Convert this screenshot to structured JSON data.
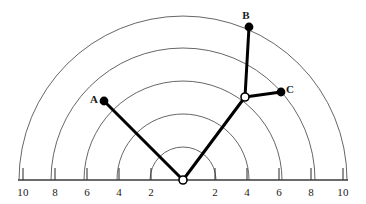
{
  "figure": {
    "background_color": "#ffffff",
    "line_color": "#000000",
    "arc_color": "#555555",
    "axis_color": "#3a3a3a"
  },
  "axis": {
    "name": "horizontal-baseline",
    "y_px": 180,
    "x_start_px": 18,
    "x_end_px": 348,
    "origin_x_px": 183,
    "tick_length_px": 12,
    "labels": [
      {
        "text": "10",
        "value": -10,
        "x_px": 23
      },
      {
        "text": "8",
        "value": -8,
        "x_px": 55
      },
      {
        "text": "6",
        "value": -6,
        "x_px": 87
      },
      {
        "text": "4",
        "value": -4,
        "x_px": 119
      },
      {
        "text": "2",
        "value": -2,
        "x_px": 151
      },
      {
        "text": "2",
        "value": 2,
        "x_px": 215
      },
      {
        "text": "4",
        "value": 4,
        "x_px": 247
      },
      {
        "text": "6",
        "value": 6,
        "x_px": 279
      },
      {
        "text": "8",
        "value": 8,
        "x_px": 311
      },
      {
        "text": "10",
        "value": 10,
        "x_px": 343
      }
    ],
    "label_y_px": 186
  },
  "chart_data": {
    "type": "scatter",
    "xlabel": "",
    "ylabel": "",
    "xlim": [
      -10,
      10
    ],
    "ylim": [
      0,
      10
    ],
    "grid": "polar-semicircle",
    "radial_gridlines": {
      "values": [
        2,
        4,
        6,
        8,
        10
      ],
      "radius_px": [
        33,
        66,
        99,
        132,
        164
      ],
      "color": "#555555"
    },
    "origin": {
      "label": "O",
      "x": 0,
      "y": 0,
      "x_px": 183,
      "y_px": 180,
      "marker": "open-circle"
    },
    "joint": {
      "label": "",
      "x": 3.8,
      "y": 5.1,
      "x_px": 245,
      "y_px": 97,
      "marker": "open-circle"
    },
    "points": [
      {
        "name": "A",
        "x": -4.9,
        "y": 4.9,
        "x_px": 104,
        "y_px": 101,
        "marker": "filled-circle",
        "label_x_px": 94,
        "label_y_px": 99
      },
      {
        "name": "B",
        "x": 4.1,
        "y": 9.4,
        "x_px": 249,
        "y_px": 27,
        "marker": "filled-circle",
        "label_x_px": 246,
        "label_y_px": 15
      },
      {
        "name": "C",
        "x": 6.1,
        "y": 5.4,
        "x_px": 281,
        "y_px": 92,
        "marker": "filled-circle",
        "label_x_px": 290,
        "label_y_px": 89
      }
    ],
    "segments": [
      {
        "name": "origin-to-A",
        "from": "origin",
        "to": "A",
        "x1_px": 183,
        "y1_px": 180,
        "x2_px": 104,
        "y2_px": 101
      },
      {
        "name": "origin-to-joint",
        "from": "origin",
        "to": "joint",
        "x1_px": 183,
        "y1_px": 180,
        "x2_px": 245,
        "y2_px": 97
      },
      {
        "name": "joint-to-B",
        "from": "joint",
        "to": "B",
        "x1_px": 245,
        "y1_px": 97,
        "x2_px": 249,
        "y2_px": 27
      },
      {
        "name": "joint-to-C",
        "from": "joint",
        "to": "C",
        "x1_px": 245,
        "y1_px": 97,
        "x2_px": 281,
        "y2_px": 92
      }
    ]
  }
}
